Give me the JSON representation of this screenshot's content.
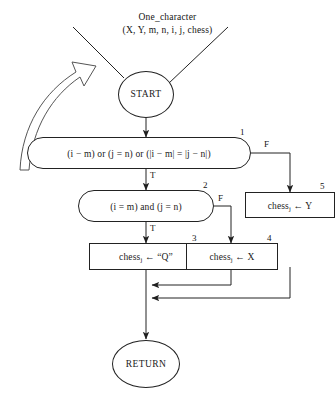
{
  "diagram": {
    "type": "flowchart",
    "title_lines": [
      "One_character",
      "(X, Y, m, n, i, j, chess)"
    ],
    "terminals": {
      "start": "START",
      "end": "RETURN"
    },
    "nodes": [
      {
        "id": "n1",
        "step": "1",
        "shape": "decision",
        "text": "(i − m) or (j = n) or (|i − m| = |j − n|)",
        "true_label": "T",
        "false_label": "F"
      },
      {
        "id": "n2",
        "step": "2",
        "shape": "decision",
        "text": "(i = m) and (j = n)",
        "true_label": "T",
        "false_label": "F"
      },
      {
        "id": "n3",
        "step": "3",
        "shape": "process",
        "text_prefix": "chess",
        "subscript": "j",
        "text_suffix": " ← “Q”"
      },
      {
        "id": "n4",
        "step": "4",
        "shape": "process",
        "text_prefix": "chess",
        "subscript": "j",
        "text_suffix": " ← X"
      },
      {
        "id": "n5",
        "step": "5",
        "shape": "process",
        "text_prefix": "chess",
        "subscript": "j",
        "text_suffix": " ← Y"
      }
    ],
    "annotation": {
      "callout_arrow": "curved-hollow-arrow"
    },
    "colors": {
      "stroke": "#222222",
      "text": "#141414",
      "background": "#ffffff"
    }
  }
}
